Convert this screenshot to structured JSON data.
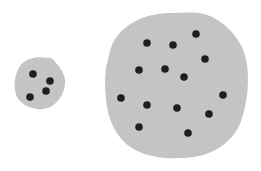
{
  "diagram": {
    "colors": {
      "blob": "#c4c4c4",
      "dot": "#1e1e1e",
      "background": "#ffffff"
    },
    "blobs": [
      {
        "name": "small-blob",
        "path": "M20,66 C26,58 38,56 46,58 C50,57 54,59 55,62 C61,68 66,76 65,84 C64,94 58,104 48,108 C38,111 26,108 19,100 C13,93 13,76 20,66 Z",
        "dots": [
          [
            33,
            74
          ],
          [
            50,
            81
          ],
          [
            46,
            91
          ],
          [
            30,
            97
          ]
        ]
      },
      {
        "name": "large-blob",
        "path": "M118,35 C132,18 155,12 175,13 C188,13 198,11 210,16 C228,24 244,42 247,64 C250,86 246,108 240,124 C232,142 214,154 194,157 C170,160 148,158 132,148 C116,138 108,120 106,100 C105,86 104,72 108,60 C110,50 112,42 118,35 Z",
        "dots": [
          [
            147,
            43
          ],
          [
            173,
            45
          ],
          [
            196,
            34
          ],
          [
            205,
            59
          ],
          [
            139,
            70
          ],
          [
            165,
            69
          ],
          [
            184,
            77
          ],
          [
            121,
            98
          ],
          [
            147,
            105
          ],
          [
            177,
            108
          ],
          [
            223,
            95
          ],
          [
            209,
            114
          ],
          [
            139,
            127
          ],
          [
            188,
            133
          ]
        ]
      }
    ],
    "dot_radius": 3.8
  }
}
